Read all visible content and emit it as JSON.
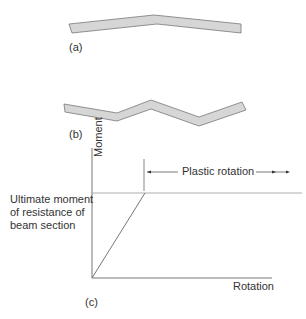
{
  "figure": {
    "panel_a": {
      "label": "(a)"
    },
    "panel_b": {
      "label": "(b)"
    },
    "panel_c": {
      "label": "(c)",
      "y_axis_label": "Moment",
      "x_axis_label": "Rotation",
      "ultimate_moment_label": [
        "Ultimate moment",
        "of resistance of",
        "beam section"
      ],
      "plastic_rotation_label": "Plastic rotation"
    }
  },
  "colors": {
    "beam_fill": "#d6d6d6",
    "beam_stroke": "#777777",
    "line": "#777777",
    "text": "#333333"
  }
}
